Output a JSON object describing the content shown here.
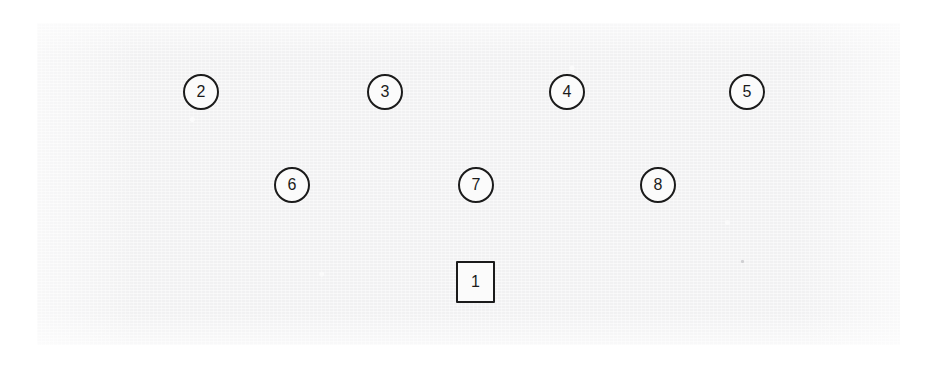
{
  "page": {
    "canvas": {
      "width": 938,
      "height": 374
    },
    "background_color": "#ffffff"
  },
  "scan": {
    "name": "scanned-paper-region",
    "background_color": "#f1f1f2",
    "bounds": {
      "x": 37,
      "y": 23,
      "width": 863,
      "height": 322
    },
    "has_speck": true,
    "speck": {
      "x": 741,
      "y": 260,
      "color": "#c9c9cc"
    }
  },
  "style": {
    "marker_stroke_color": "#1b1b1b",
    "marker_fill_color": "#fbfbfb",
    "label_color": "#1b1b1b"
  },
  "diagram": {
    "marker_count": 9,
    "rows": [
      {
        "name": "top-row",
        "markers": [
          {
            "label": "2",
            "shape": "circle",
            "cx": 201,
            "cy": 92
          },
          {
            "label": "3",
            "shape": "circle",
            "cx": 385,
            "cy": 92
          },
          {
            "label": "4",
            "shape": "circle",
            "cx": 567,
            "cy": 92
          },
          {
            "label": "5",
            "shape": "circle",
            "cx": 747,
            "cy": 92
          }
        ]
      },
      {
        "name": "middle-row",
        "markers": [
          {
            "label": "6",
            "shape": "circle",
            "cx": 292,
            "cy": 185
          },
          {
            "label": "7",
            "shape": "circle",
            "cx": 476,
            "cy": 185
          },
          {
            "label": "8",
            "shape": "circle",
            "cx": 658,
            "cy": 185
          }
        ]
      },
      {
        "name": "bottom-row",
        "markers": [
          {
            "label": "1",
            "shape": "square",
            "cx": 475,
            "cy": 282
          }
        ]
      }
    ],
    "markers_flat": [
      {
        "label": "1",
        "shape": "square"
      },
      {
        "label": "2",
        "shape": "circle"
      },
      {
        "label": "3",
        "shape": "circle"
      },
      {
        "label": "4",
        "shape": "circle"
      },
      {
        "label": "5",
        "shape": "circle"
      },
      {
        "label": "6",
        "shape": "circle"
      },
      {
        "label": "7",
        "shape": "circle"
      },
      {
        "label": "8",
        "shape": "circle"
      }
    ]
  }
}
